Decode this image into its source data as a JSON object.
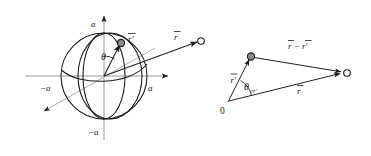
{
  "figure": {
    "panels": [
      {
        "id": "sphere-panel",
        "name": "sphere-diagram",
        "labels": {
          "axis_top": "a",
          "axis_left": "−a",
          "axis_right": "a",
          "axis_bottom": "−a",
          "angle": "θ",
          "source_vector": "r′",
          "field_vector": "r"
        },
        "elements": {
          "sphere_radius_label": "a",
          "source_point_name": "r-prime-point",
          "field_point_name": "r-point"
        }
      },
      {
        "id": "triangle-panel",
        "name": "vector-triangle-diagram",
        "labels": {
          "origin": "0",
          "source_vector": "r′",
          "field_vector": "r",
          "difference_vector": "r − r′",
          "angle": "θ",
          "angle_subscript": "rr′"
        }
      }
    ],
    "colors": {
      "ink": "#1a1a1a",
      "axis_grey": "#9a9a9a",
      "node_fill": "#8c8c8c",
      "background": "#ffffff"
    }
  }
}
